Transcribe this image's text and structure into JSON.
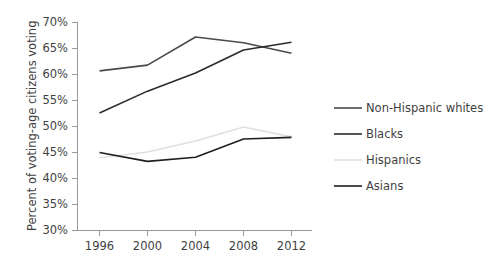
{
  "chart_data": {
    "type": "line",
    "title": "",
    "xlabel": "",
    "ylabel": "Percent of voting-age citizens voting",
    "categories": [
      "1996",
      "2000",
      "2004",
      "2008",
      "2012"
    ],
    "x": [
      1996,
      2000,
      2004,
      2008,
      2012
    ],
    "ylim": [
      30,
      70
    ],
    "ytick_labels": [
      "30%",
      "35%",
      "40%",
      "45%",
      "50%",
      "55%",
      "60%",
      "65%",
      "70%"
    ],
    "ytick_values": [
      30,
      35,
      40,
      45,
      50,
      55,
      60,
      65,
      70
    ],
    "grid": false,
    "legend_position": "right",
    "series": [
      {
        "name": "Non-Hispanic whites",
        "color": "#4a4a4a",
        "values": [
          60.7,
          61.8,
          67.2,
          66.1,
          64.1
        ]
      },
      {
        "name": "Blacks",
        "color": "#2b2b2b",
        "values": [
          52.6,
          56.8,
          60.3,
          64.7,
          66.2
        ]
      },
      {
        "name": "Hispanics",
        "color": "#e0e0e0",
        "values": [
          44.0,
          45.1,
          47.2,
          49.9,
          48.0
        ]
      },
      {
        "name": "Asians",
        "color": "#1f1f1f",
        "values": [
          45.0,
          43.3,
          44.1,
          47.6,
          47.9
        ]
      }
    ]
  },
  "axis": {
    "y_title": "Percent of voting-age citizens voting",
    "y_ticks": [
      "70%",
      "65%",
      "60%",
      "55%",
      "50%",
      "45%",
      "40%",
      "35%",
      "30%"
    ],
    "x_ticks": [
      "1996",
      "2000",
      "2004",
      "2008",
      "2012"
    ]
  },
  "legend": {
    "entries": [
      {
        "label": "Non-Hispanic whites",
        "color": "#4a4a4a"
      },
      {
        "label": "Blacks",
        "color": "#2b2b2b"
      },
      {
        "label": "Hispanics",
        "color": "#e0e0e0"
      },
      {
        "label": "Asians",
        "color": "#1f1f1f"
      }
    ]
  }
}
